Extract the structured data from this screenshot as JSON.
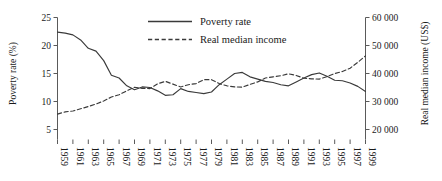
{
  "chart_data": {
    "type": "line",
    "title": "",
    "xlabel": "",
    "ylabel": "Poverty rate (%)",
    "y2label": "Real median income (US$)",
    "grid": false,
    "legend_position": "top-center",
    "xlim": [
      1959,
      1999
    ],
    "ylim": [
      5,
      25
    ],
    "y2lim": [
      20000,
      60000
    ],
    "yticks": [
      5,
      10,
      15,
      20,
      25
    ],
    "ytick_labels": [
      "5",
      "10",
      "15",
      "20",
      "25"
    ],
    "y2ticks": [
      20000,
      30000,
      40000,
      50000,
      60000
    ],
    "y2tick_labels": [
      "20 000",
      "30 000",
      "40 000",
      "50 000",
      "60 000"
    ],
    "xticks": [
      1959,
      1961,
      1963,
      1965,
      1967,
      1969,
      1971,
      1973,
      1975,
      1977,
      1979,
      1981,
      1983,
      1985,
      1987,
      1989,
      1991,
      1993,
      1995,
      1997,
      1999
    ],
    "xtick_labels": [
      "1959",
      "1961",
      "1963",
      "1965",
      "1967",
      "1969",
      "1971",
      "1973",
      "1975",
      "1977",
      "1979",
      "1981",
      "1983",
      "1985",
      "1987",
      "1989",
      "1991",
      "1993",
      "1995",
      "1997",
      "1999"
    ],
    "x": [
      1959,
      1960,
      1961,
      1962,
      1963,
      1964,
      1965,
      1966,
      1967,
      1968,
      1969,
      1970,
      1971,
      1972,
      1973,
      1974,
      1975,
      1976,
      1977,
      1978,
      1979,
      1980,
      1981,
      1982,
      1983,
      1984,
      1985,
      1986,
      1987,
      1988,
      1989,
      1990,
      1991,
      1992,
      1993,
      1994,
      1995,
      1996,
      1997,
      1998,
      1999
    ],
    "series": [
      {
        "name": "Poverty rate",
        "axis": "left",
        "style": "solid",
        "color": "#3a3a3a",
        "unit": "%",
        "values": [
          22.4,
          22.2,
          21.9,
          21.0,
          19.5,
          19.0,
          17.3,
          14.7,
          14.2,
          12.8,
          12.1,
          12.6,
          12.5,
          11.9,
          11.1,
          11.2,
          12.3,
          11.8,
          11.6,
          11.4,
          11.7,
          13.0,
          14.0,
          15.0,
          15.2,
          14.4,
          14.0,
          13.6,
          13.4,
          13.0,
          12.8,
          13.5,
          14.2,
          14.8,
          15.1,
          14.5,
          13.8,
          13.7,
          13.3,
          12.7,
          11.8
        ]
      },
      {
        "name": "Real median income",
        "axis": "right",
        "style": "dashed",
        "color": "#3a3a3a",
        "unit": "US$",
        "values": [
          25500,
          26300,
          26600,
          27400,
          28200,
          29100,
          30200,
          31600,
          32400,
          33800,
          35100,
          34700,
          34600,
          36300,
          37200,
          36200,
          35200,
          36000,
          36400,
          37800,
          37800,
          36400,
          35600,
          35200,
          35100,
          36100,
          37000,
          38400,
          38800,
          39200,
          39900,
          39300,
          38300,
          38100,
          38000,
          38900,
          40000,
          40700,
          41900,
          44000,
          46300
        ]
      }
    ],
    "legend": [
      {
        "label": "Poverty rate",
        "style": "solid"
      },
      {
        "label": "Real median income",
        "style": "dashed"
      }
    ]
  }
}
